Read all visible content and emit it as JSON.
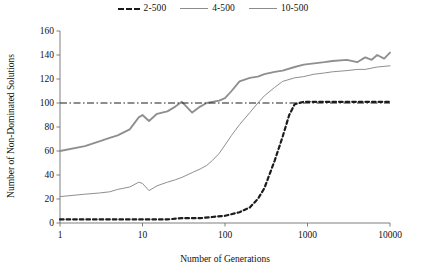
{
  "chart_data": {
    "type": "line",
    "title": "",
    "xlabel": "Number of Generations",
    "ylabel": "Number of Non-Dominated Solutions",
    "xscale": "log",
    "xlim": [
      1,
      10000
    ],
    "ylim": [
      0,
      160
    ],
    "xticks": [
      1,
      10,
      100,
      1000,
      10000
    ],
    "xticklabels": [
      "1",
      "10",
      "100",
      "1000",
      "10000"
    ],
    "yticks": [
      0,
      20,
      40,
      60,
      80,
      100,
      120,
      140,
      160
    ],
    "yticklabels": [
      "0",
      "20",
      "40",
      "60",
      "80",
      "100",
      "120",
      "140",
      "160"
    ],
    "grid": false,
    "legend_position": "top-center",
    "legend": [
      "2-500",
      "4-500",
      "10-500"
    ],
    "reference_line": {
      "y": 100,
      "style": "dash-dot",
      "color": "#1c1c1c"
    },
    "colors": {
      "2-500": "#1c1c1c",
      "4-500": "#8f8f8f",
      "10-500": "#8f8f8f",
      "axis": "#6f6f6f",
      "text": "#111111",
      "background": "#ffffff"
    },
    "series": [
      {
        "name": "2-500",
        "style": "dashed",
        "x": [
          1,
          2,
          3,
          5,
          7,
          10,
          15,
          20,
          30,
          50,
          70,
          100,
          150,
          200,
          250,
          300,
          400,
          500,
          600,
          700,
          900,
          1200,
          2000,
          3000,
          5000,
          7000,
          10000
        ],
        "values": [
          3,
          3,
          3,
          3,
          3,
          3,
          3,
          3,
          4,
          4,
          5,
          6,
          9,
          13,
          20,
          29,
          52,
          72,
          90,
          99,
          101,
          101,
          101,
          101,
          101,
          101,
          101
        ]
      },
      {
        "name": "4-500",
        "style": "solid-thin",
        "x": [
          1,
          2,
          3,
          4,
          5,
          7,
          9,
          10,
          12,
          15,
          20,
          25,
          30,
          40,
          50,
          60,
          70,
          85,
          100,
          120,
          150,
          200,
          250,
          300,
          400,
          500,
          700,
          900,
          1200,
          1600,
          2000,
          3000,
          4000,
          5000,
          7000,
          10000
        ],
        "values": [
          22,
          24,
          25,
          26,
          28,
          30,
          34,
          33,
          27,
          31,
          34,
          36,
          38,
          42,
          45,
          48,
          52,
          58,
          65,
          73,
          82,
          92,
          100,
          106,
          113,
          118,
          121,
          122,
          124,
          125,
          126,
          127,
          128,
          128,
          130,
          131
        ]
      },
      {
        "name": "10-500",
        "style": "solid-thick",
        "x": [
          1,
          2,
          3,
          4,
          5,
          7,
          9,
          10,
          12,
          15,
          20,
          25,
          30,
          40,
          50,
          60,
          70,
          85,
          100,
          120,
          150,
          200,
          250,
          300,
          400,
          500,
          700,
          900,
          1200,
          1600,
          2000,
          3000,
          4000,
          5000,
          6000,
          7000,
          8500,
          10000
        ],
        "values": [
          60,
          64,
          68,
          71,
          73,
          78,
          88,
          90,
          85,
          91,
          93,
          97,
          101,
          92,
          97,
          100,
          101,
          102,
          104,
          110,
          118,
          121,
          122,
          124,
          126,
          127,
          130,
          132,
          133,
          134,
          135,
          136,
          134,
          138,
          136,
          140,
          137,
          142
        ]
      }
    ]
  }
}
